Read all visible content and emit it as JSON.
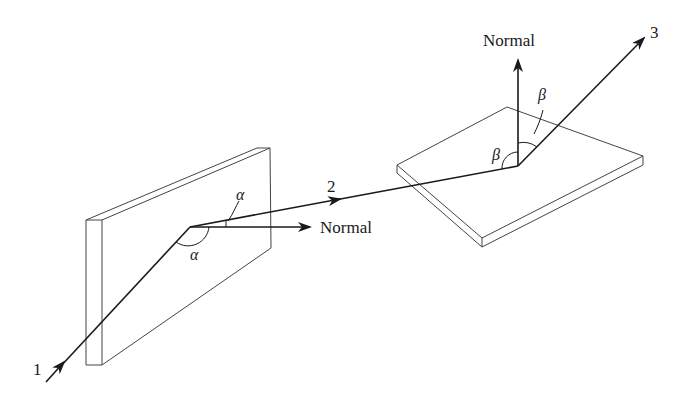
{
  "diagram": {
    "type": "reflection-geometry",
    "colors": {
      "line": "#1a1a1a",
      "plate": "#444444",
      "background": "#ffffff"
    }
  },
  "labels": {
    "ray1": "1",
    "ray2": "2",
    "ray3": "3",
    "normal_left": "Normal",
    "normal_right": "Normal",
    "alpha_top": "α",
    "alpha_bottom": "α",
    "beta_left": "β",
    "beta_right": "β"
  },
  "elements": {
    "vertical_mirror": {
      "name": "Vertical mirror plate"
    },
    "horizontal_mirror": {
      "name": "Horizontal mirror plate"
    },
    "incident_ray": {
      "label": "1"
    },
    "first_reflected_ray": {
      "label": "2"
    },
    "final_reflected_ray": {
      "label": "3"
    },
    "angles": [
      {
        "symbol": "α",
        "meaning": "angle of incidence/reflection at vertical mirror"
      },
      {
        "symbol": "β",
        "meaning": "angle of incidence/reflection at horizontal mirror"
      }
    ]
  }
}
